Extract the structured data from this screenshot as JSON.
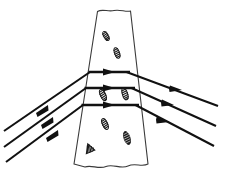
{
  "figure": {
    "background_color": "#ffffff",
    "width": 226,
    "height": 177,
    "line_color": "#111111",
    "band_stroke_color": "#3a3a3a",
    "hatch_color": "#1b1b1b"
  },
  "chart_data": {
    "type": "diagram",
    "title": "",
    "band": {
      "name": "tapering-band",
      "shape": "trapezoid",
      "top_left_x": 97,
      "top_right_x": 131,
      "bottom_left_x": 74,
      "bottom_right_x": 148,
      "top_y": 10,
      "bottom_y": 166,
      "top_edge": "wavy-torn",
      "bottom_edge": "wavy-torn"
    },
    "rays": [
      {
        "id": "ray-1",
        "incoming_start": [
          4,
          131
        ],
        "entry_point": [
          90,
          72
        ],
        "exit_point": [
          128,
          72
        ],
        "outgoing_end": [
          218,
          106
        ],
        "inside_orientation": "horizontal",
        "arrow_count": 3
      },
      {
        "id": "ray-2",
        "incoming_start": [
          4,
          147
        ],
        "entry_point": [
          86,
          88
        ],
        "exit_point": [
          133,
          88
        ],
        "outgoing_end": [
          216,
          126
        ],
        "inside_orientation": "horizontal",
        "arrow_count": 3
      },
      {
        "id": "ray-3",
        "incoming_start": [
          6,
          162
        ],
        "entry_point": [
          83,
          105
        ],
        "exit_point": [
          137,
          105
        ],
        "outgoing_end": [
          214,
          146
        ],
        "inside_orientation": "horizontal",
        "arrow_count": 3
      }
    ],
    "hatch_marks": [
      {
        "id": "hatch-1",
        "x": 106,
        "y": 36,
        "angle": 60,
        "length": 9,
        "style": "blob"
      },
      {
        "id": "hatch-2",
        "x": 117,
        "y": 53,
        "angle": 70,
        "length": 10,
        "style": "blob"
      },
      {
        "id": "hatch-3",
        "x": 103,
        "y": 95,
        "angle": 65,
        "length": 11,
        "style": "blob"
      },
      {
        "id": "hatch-4",
        "x": 125,
        "y": 94,
        "angle": 72,
        "length": 11,
        "style": "blob"
      },
      {
        "id": "hatch-5",
        "x": 105,
        "y": 124,
        "angle": 65,
        "length": 11,
        "style": "blob"
      },
      {
        "id": "hatch-6",
        "x": 127,
        "y": 138,
        "angle": 72,
        "length": 13,
        "style": "blob-filled"
      },
      {
        "id": "hatch-7",
        "x": 89,
        "y": 148,
        "angle": 60,
        "length": 10,
        "style": "fan"
      }
    ],
    "axis_labels": [],
    "legend": []
  }
}
